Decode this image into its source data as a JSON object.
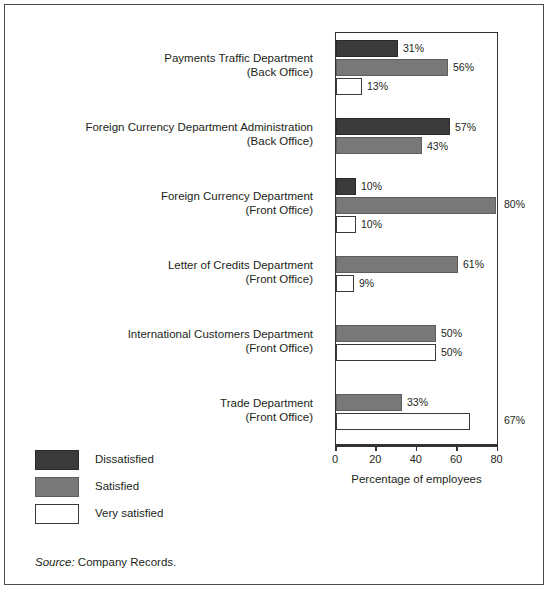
{
  "chart_data": {
    "type": "bar",
    "orientation": "horizontal",
    "title": "",
    "xlabel": "Percentage of employees",
    "ylabel": "",
    "xlim": [
      0,
      80
    ],
    "xticks": [
      0,
      20,
      40,
      60,
      80
    ],
    "xtick_labels": [
      "0",
      "20",
      "40",
      "60",
      "80"
    ],
    "grid": false,
    "legend_position": "bottom-left",
    "value_suffix": "%",
    "categories": [
      {
        "line1": "Payments Traffic Department",
        "line2": "(Back Office)"
      },
      {
        "line1": "Foreign Currency Department Administration",
        "line2": "(Back Office)"
      },
      {
        "line1": "Foreign Currency Department",
        "line2": "(Front Office)"
      },
      {
        "line1": "Letter of Credits Department",
        "line2": "(Front Office)"
      },
      {
        "line1": "International Customers Department",
        "line2": "(Front Office)"
      },
      {
        "line1": "Trade Department",
        "line2": "(Front Office)"
      }
    ],
    "series": [
      {
        "name": "Dissatisfied",
        "color": "#3b3b3b",
        "values": [
          31,
          57,
          10,
          null,
          null,
          null
        ],
        "labels": [
          "31%",
          "57%",
          "10%",
          null,
          null,
          null
        ]
      },
      {
        "name": "Satisfied",
        "color": "#787878",
        "values": [
          56,
          43,
          80,
          61,
          50,
          33
        ],
        "labels": [
          "56%",
          "43%",
          "80%",
          "61%",
          "50%",
          "33%"
        ]
      },
      {
        "name": "Very satisfied",
        "color": "#ffffff",
        "values": [
          13,
          null,
          10,
          9,
          50,
          67
        ],
        "labels": [
          "13%",
          null,
          "10%",
          "9%",
          "50%",
          "67%"
        ]
      }
    ]
  },
  "legend": {
    "items": [
      {
        "label": "Dissatisfied",
        "swatch": "dissatisfied"
      },
      {
        "label": "Satisfied",
        "swatch": "satisfied"
      },
      {
        "label": "Very satisfied",
        "swatch": "verysatisfied"
      }
    ]
  },
  "source": {
    "prefix": "Source:",
    "text": "Company Records."
  }
}
